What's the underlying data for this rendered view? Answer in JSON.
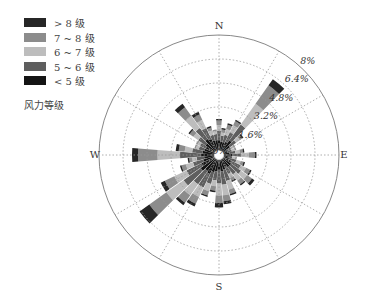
{
  "chart_data": {
    "type": "windrose",
    "title": "",
    "legend_title": "风力等级",
    "legend_position": "upper-left",
    "directions_labels": {
      "N": "N",
      "E": "E",
      "S": "S",
      "W": "W"
    },
    "radial_ticks": [
      "0%",
      "1.6%",
      "3.2%",
      "4.8%",
      "6.4%",
      "8%"
    ],
    "radial_values": [
      0,
      1.6,
      3.2,
      4.8,
      6.4,
      8
    ],
    "rmax": 8,
    "grid": true,
    "sector_width_deg": 10,
    "angles_deg": [
      0,
      10,
      20,
      30,
      40,
      50,
      60,
      70,
      80,
      90,
      100,
      110,
      120,
      130,
      140,
      150,
      160,
      170,
      180,
      190,
      200,
      210,
      220,
      230,
      240,
      250,
      260,
      270,
      280,
      290,
      300,
      310,
      320,
      330,
      340,
      350
    ],
    "series": [
      {
        "name": "<5 级",
        "color": "#141414",
        "values": [
          1.0,
          0.9,
          0.9,
          1.0,
          1.2,
          0.9,
          0.6,
          0.6,
          0.7,
          0.9,
          0.6,
          0.7,
          0.9,
          1.0,
          1.0,
          0.9,
          1.0,
          1.1,
          1.0,
          1.1,
          1.2,
          1.4,
          1.3,
          1.5,
          1.3,
          1.1,
          1.0,
          1.2,
          1.1,
          1.0,
          1.0,
          1.1,
          1.3,
          1.2,
          1.0,
          1.0
        ]
      },
      {
        "name": "5 ~ 6 级",
        "color": "#5e5e5e",
        "values": [
          0.6,
          0.4,
          0.5,
          0.7,
          1.3,
          0.5,
          0.3,
          0.3,
          0.4,
          0.6,
          0.3,
          0.5,
          0.7,
          0.8,
          0.6,
          0.5,
          0.8,
          0.9,
          0.9,
          0.6,
          0.8,
          1.0,
          1.1,
          1.4,
          1.1,
          0.7,
          0.5,
          1.4,
          0.7,
          0.4,
          0.4,
          0.6,
          0.9,
          0.8,
          0.4,
          0.4
        ]
      },
      {
        "name": "6 ~ 7 级",
        "color": "#bdbdbd",
        "values": [
          0.4,
          0.2,
          0.4,
          0.5,
          1.7,
          0.3,
          0.2,
          0.2,
          0.3,
          0.5,
          0.2,
          0.3,
          0.4,
          0.5,
          0.5,
          0.3,
          0.6,
          0.7,
          0.8,
          0.4,
          0.5,
          0.7,
          0.9,
          1.4,
          0.9,
          0.5,
          0.3,
          1.5,
          0.5,
          0.2,
          0.2,
          0.4,
          1.0,
          0.6,
          0.3,
          0.2
        ]
      },
      {
        "name": "7 ~ 8 级",
        "color": "#8c8c8c",
        "values": [
          0.3,
          0.2,
          0.3,
          0.3,
          1.5,
          0.2,
          0.1,
          0.1,
          0.2,
          0.4,
          0.1,
          0.2,
          0.3,
          0.4,
          0.3,
          0.2,
          0.3,
          0.4,
          0.5,
          0.3,
          0.3,
          0.5,
          0.6,
          1.4,
          0.7,
          0.3,
          0.2,
          1.3,
          0.4,
          0.1,
          0.1,
          0.3,
          0.7,
          0.4,
          0.2,
          0.1
        ]
      },
      {
        "name": "> 8 级",
        "color": "#262626",
        "values": [
          0.1,
          0.1,
          0.1,
          0.1,
          0.5,
          0.1,
          0.0,
          0.0,
          0.1,
          0.1,
          0.0,
          0.1,
          0.1,
          0.2,
          0.1,
          0.1,
          0.1,
          0.2,
          0.3,
          0.1,
          0.1,
          0.2,
          0.2,
          0.8,
          0.3,
          0.1,
          0.1,
          0.4,
          0.2,
          0.0,
          0.0,
          0.1,
          0.3,
          0.2,
          0.1,
          0.0
        ]
      }
    ]
  },
  "legend": {
    "items": [
      {
        "label": "> 8 级",
        "color": "#262626"
      },
      {
        "label": "7 ~ 8 级",
        "color": "#8c8c8c"
      },
      {
        "label": "6 ~ 7 级",
        "color": "#bdbdbd"
      },
      {
        "label": "5 ~ 6 级",
        "color": "#5e5e5e"
      },
      {
        "label": "< 5 级",
        "color": "#141414"
      }
    ],
    "title": "风力等级"
  }
}
